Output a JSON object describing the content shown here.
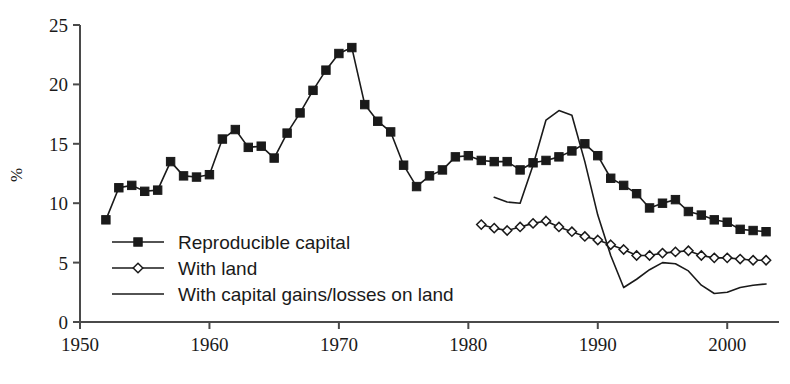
{
  "chart_data": {
    "type": "line",
    "title": "",
    "subtitle": "",
    "xlabel": "",
    "ylabel": "%",
    "xlim": [
      1950,
      2004
    ],
    "ylim": [
      0,
      25
    ],
    "grid": false,
    "legend_position": "inner-left",
    "x_ticks": [
      "1950",
      "1960",
      "1970",
      "1980",
      "1990",
      "2000"
    ],
    "x_tick_values": [
      1950,
      1960,
      1970,
      1980,
      1990,
      2000
    ],
    "y_ticks": [
      "0",
      "5",
      "10",
      "15",
      "20",
      "25"
    ],
    "y_tick_values": [
      0,
      5,
      10,
      15,
      20,
      25
    ],
    "series": [
      {
        "name": "Reproducible capital",
        "marker": "filled-square",
        "x": [
          1952,
          1953,
          1954,
          1955,
          1956,
          1957,
          1958,
          1959,
          1960,
          1961,
          1962,
          1963,
          1964,
          1965,
          1966,
          1967,
          1968,
          1969,
          1970,
          1971,
          1972,
          1973,
          1974,
          1975,
          1976,
          1977,
          1978,
          1979,
          1980,
          1981,
          1982,
          1983,
          1984,
          1985,
          1986,
          1987,
          1988,
          1989,
          1990,
          1991,
          1992,
          1993,
          1994,
          1995,
          1996,
          1997,
          1998,
          1999,
          2000,
          2001,
          2002,
          2003
        ],
        "values": [
          8.6,
          11.3,
          11.5,
          11.0,
          11.1,
          13.5,
          12.3,
          12.2,
          12.4,
          15.4,
          16.2,
          14.7,
          14.8,
          13.8,
          15.9,
          17.6,
          19.5,
          21.2,
          22.6,
          23.1,
          18.3,
          16.9,
          16.0,
          13.2,
          11.4,
          12.3,
          12.8,
          13.9,
          14.0,
          13.6,
          13.5,
          13.5,
          12.8,
          13.4,
          13.6,
          13.9,
          14.4,
          15.0,
          14.0,
          12.1,
          11.5,
          10.8,
          9.6,
          10.0,
          10.3,
          9.3,
          9.0,
          8.6,
          8.4,
          7.8,
          7.7,
          7.6
        ]
      },
      {
        "name": "With land",
        "marker": "open-diamond",
        "x": [
          1981,
          1982,
          1983,
          1984,
          1985,
          1986,
          1987,
          1988,
          1989,
          1990,
          1991,
          1992,
          1993,
          1994,
          1995,
          1996,
          1997,
          1998,
          1999,
          2000,
          2001,
          2002,
          2003
        ],
        "values": [
          8.2,
          7.9,
          7.7,
          8.0,
          8.3,
          8.5,
          8.0,
          7.6,
          7.2,
          6.9,
          6.5,
          6.1,
          5.6,
          5.6,
          5.8,
          5.9,
          6.0,
          5.6,
          5.4,
          5.4,
          5.3,
          5.2,
          5.2
        ]
      },
      {
        "name": "With capital gains/losses on land",
        "marker": "none",
        "x": [
          1982,
          1983,
          1984,
          1985,
          1986,
          1987,
          1988,
          1989,
          1990,
          1991,
          1992,
          1993,
          1994,
          1995,
          1996,
          1997,
          1998,
          1999,
          2000,
          2001,
          2002,
          2003
        ],
        "values": [
          10.5,
          10.1,
          10.0,
          13.2,
          17.0,
          17.8,
          17.4,
          13.5,
          9.0,
          5.6,
          2.9,
          3.6,
          4.4,
          5.0,
          4.9,
          4.3,
          3.1,
          2.4,
          2.5,
          2.9,
          3.1,
          3.2
        ]
      }
    ]
  },
  "legend": {
    "items": [
      {
        "label": "Reproducible capital",
        "marker": "filled-square"
      },
      {
        "label": "With land",
        "marker": "open-diamond"
      },
      {
        "label": "With capital gains/losses on land",
        "marker": "none"
      }
    ]
  },
  "colors": {
    "ink": "#1a1a1a",
    "axis": "#4a4a4a",
    "background": "#ffffff"
  }
}
